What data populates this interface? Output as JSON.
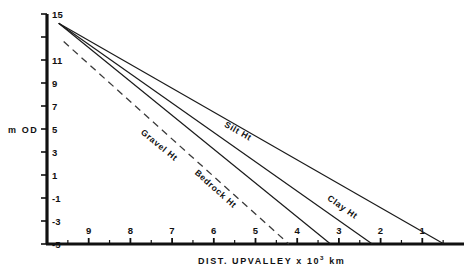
{
  "chart_data": {
    "type": "line",
    "title": "",
    "xlabel": "DIST. UPVALLEY  x 10³ km",
    "xlabel_main": "DIST.  UPVALLEY   x 10",
    "xlabel_exponent": "3",
    "xlabel_unit": " km",
    "ylabel": "m OD",
    "xlim": [
      10.0,
      0.0
    ],
    "ylim": [
      -5,
      15
    ],
    "x_axis_inverted": true,
    "grid": false,
    "legend_position": "inline-on-line",
    "x_ticks": [
      9,
      8,
      7,
      6,
      5,
      4,
      3,
      2,
      1
    ],
    "x_tick_labels": [
      "9",
      "8",
      "7",
      "6",
      "5",
      "4",
      "3",
      "2",
      "1"
    ],
    "x_minor_ticks": [
      9.5,
      8.5,
      7.5,
      6.5,
      5.5,
      4.5,
      3.5,
      2.5,
      1.5,
      0.5
    ],
    "y_ticks": [
      15,
      13,
      11,
      9,
      7,
      5,
      3,
      1,
      -1,
      -3,
      -5
    ],
    "y_tick_labels": [
      "15",
      "",
      "11",
      "9",
      "7",
      "5",
      "3",
      "1",
      "-1",
      "-3",
      "-5"
    ],
    "series": [
      {
        "name": "Silt Ht",
        "label": "Silt Ht",
        "style": "solid",
        "color": "#1a1a1a",
        "x": [
          9.72,
          0.48
        ],
        "y": [
          14.2,
          -5.0
        ],
        "label_x": 5.45,
        "label_y": 4.6
      },
      {
        "name": "Clay Ht",
        "label": "Clay Ht",
        "style": "solid",
        "color": "#1a1a1a",
        "x": [
          9.72,
          2.2
        ],
        "y": [
          14.2,
          -5.0
        ],
        "label_x": 2.95,
        "label_y": -2.0
      },
      {
        "name": "Gravel Ht",
        "label": "Gravel Ht",
        "style": "solid",
        "color": "#1a1a1a",
        "x": [
          9.72,
          3.2
        ],
        "y": [
          14.2,
          -5.0
        ],
        "label_x": 7.35,
        "label_y": 3.4
      },
      {
        "name": "Bedrock Ht",
        "label": "Bedrock Ht",
        "style": "dashed",
        "color": "#3a3a3a",
        "x": [
          9.6,
          4.2
        ],
        "y": [
          12.6,
          -5.0
        ],
        "label_x": 6.0,
        "label_y": -0.4
      }
    ]
  }
}
